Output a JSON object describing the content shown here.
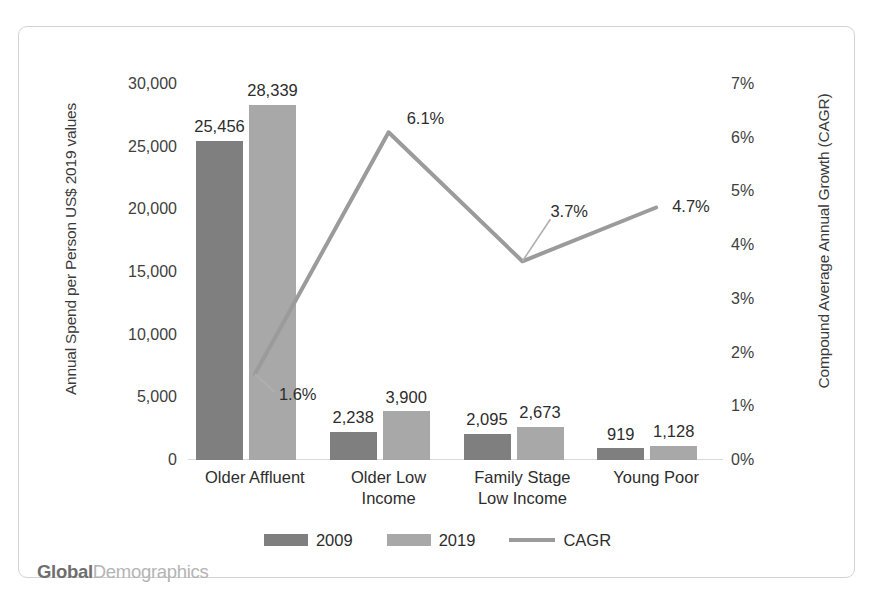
{
  "chart_data": {
    "type": "bar",
    "title": "",
    "subtitle": "",
    "categories": [
      "Older Affluent",
      "Older Low Income",
      "Family Stage Low Income",
      "Young Poor"
    ],
    "category_lines": [
      [
        "Older Affluent"
      ],
      [
        "Older Low",
        "Income"
      ],
      [
        "Family Stage",
        "Low Income"
      ],
      [
        "Young Poor"
      ]
    ],
    "series": [
      {
        "name": "2009",
        "type": "bar",
        "axis": "left",
        "color": "#7f7f7f",
        "values": [
          25456,
          2238,
          2095,
          919
        ],
        "labels": [
          "25,456",
          "2,238",
          "2,095",
          "919"
        ]
      },
      {
        "name": "2019",
        "type": "bar",
        "axis": "left",
        "color": "#a8a8a8",
        "values": [
          28339,
          3900,
          2673,
          1128
        ],
        "labels": [
          "28,339",
          "3,900",
          "2,673",
          "1,128"
        ]
      },
      {
        "name": "CAGR",
        "type": "line",
        "axis": "right",
        "color": "#9b9b9b",
        "values": [
          1.6,
          6.1,
          3.7,
          4.7
        ],
        "labels": [
          "1.6%",
          "6.1%",
          "3.7%",
          "4.7%"
        ]
      }
    ],
    "xlabel": "",
    "ylabel": "Annual Spend per Person US$ 2019 values",
    "y2label": "Compound Average Annual Growth (CAGR)",
    "ylim": [
      0,
      30000
    ],
    "y2lim": [
      0,
      7
    ],
    "yticks": [
      0,
      5000,
      10000,
      15000,
      20000,
      25000,
      30000
    ],
    "ytick_labels": [
      "0",
      "5,000",
      "10,000",
      "15,000",
      "20,000",
      "25,000",
      "30,000"
    ],
    "y2ticks": [
      0,
      1,
      2,
      3,
      4,
      5,
      6,
      7
    ],
    "y2tick_labels": [
      "0%",
      "1%",
      "2%",
      "3%",
      "4%",
      "5%",
      "6%",
      "7%"
    ],
    "grid": false,
    "legend_position": "bottom"
  },
  "legend": {
    "items": [
      {
        "label": "2009",
        "marker": "square-swatch",
        "color": "#7f7f7f"
      },
      {
        "label": "2019",
        "marker": "square-swatch",
        "color": "#a8a8a8"
      },
      {
        "label": "CAGR",
        "marker": "line-swatch",
        "color": "#9b9b9b"
      }
    ]
  },
  "watermark": {
    "part_bold": "Global",
    "part_light": "Demographics"
  }
}
